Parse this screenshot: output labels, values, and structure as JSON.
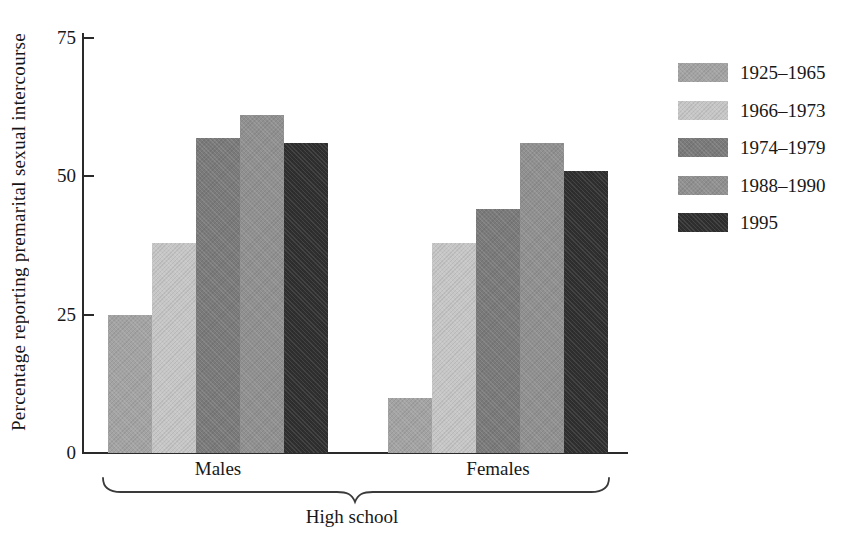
{
  "chart_data": {
    "type": "bar",
    "title": "",
    "ylabel": "Percentage reporting premarital sexual intercourse",
    "xlabel": "",
    "categories": [
      "Males",
      "Females"
    ],
    "annotation": "High school",
    "series": [
      {
        "name": "1925–1965",
        "color": "#a3a3a3",
        "values": [
          25,
          10
        ]
      },
      {
        "name": "1966–1973",
        "color": "#c6c6c6",
        "values": [
          38,
          38
        ]
      },
      {
        "name": "1974–1979",
        "color": "#7a7a7a",
        "values": [
          57,
          44
        ]
      },
      {
        "name": "1988–1990",
        "color": "#909090",
        "values": [
          61,
          56
        ]
      },
      {
        "name": "1995",
        "color": "#2f2f2f",
        "values": [
          56,
          51
        ]
      }
    ],
    "ylim": [
      0,
      75
    ],
    "yticks": [
      0,
      25,
      50,
      75
    ],
    "grid": false,
    "legend_position": "right",
    "axis_color": "#2a2a2a",
    "background_color": "#ffffff"
  }
}
